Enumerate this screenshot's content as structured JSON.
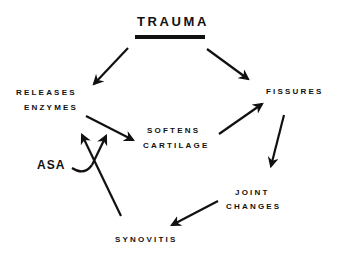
{
  "diagram": {
    "title": "TRAUMA",
    "nodes": {
      "releases_enzymes": {
        "line1": "RELEASES",
        "line2": "ENZYMES"
      },
      "fissures": {
        "line1": "FISSURES"
      },
      "softens_cartilage": {
        "line1": "SOFTENS",
        "line2": "CARTILAGE"
      },
      "joint_changes": {
        "line1": "JOINT",
        "line2": "CHANGES"
      },
      "synovitis": {
        "line1": "SYNOVITIS"
      }
    },
    "inhibitor": {
      "label": "ASA"
    },
    "edges": [
      {
        "from": "TRAUMA",
        "to": "RELEASES ENZYMES"
      },
      {
        "from": "TRAUMA",
        "to": "FISSURES"
      },
      {
        "from": "RELEASES ENZYMES",
        "to": "SOFTENS CARTILAGE"
      },
      {
        "from": "SOFTENS CARTILAGE",
        "to": "FISSURES"
      },
      {
        "from": "FISSURES",
        "to": "JOINT CHANGES"
      },
      {
        "from": "JOINT CHANGES",
        "to": "SYNOVITIS"
      },
      {
        "from": "SYNOVITIS",
        "to": "RELEASES ENZYMES"
      },
      {
        "from": "ASA",
        "to": "RELEASES ENZYMES -> SOFTENS CARTILAGE"
      }
    ],
    "colors": {
      "ink": "#111111",
      "background": "#ffffff"
    }
  }
}
